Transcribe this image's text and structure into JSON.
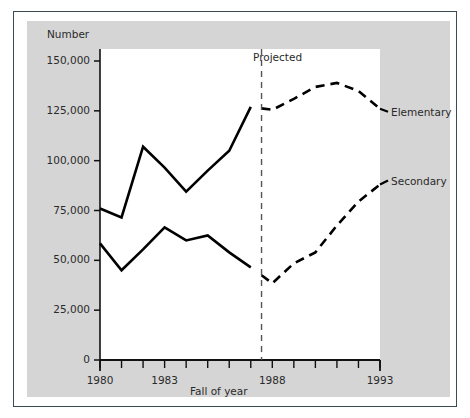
{
  "chart_data": {
    "type": "line",
    "title": "",
    "xlabel": "Fall of year",
    "ylabel": "Number",
    "ylim": [
      0,
      150000
    ],
    "xlim": [
      1980,
      1993
    ],
    "grid": false,
    "legend_position": "right-inline",
    "y_ticks": [
      0,
      25000,
      50000,
      75000,
      100000,
      125000,
      150000
    ],
    "y_tick_labels": [
      "0",
      "25,000",
      "50,000",
      "75,000",
      "100,000",
      "125,000",
      "150,000"
    ],
    "x_ticks": [
      1980,
      1981,
      1982,
      1983,
      1984,
      1985,
      1986,
      1987,
      1988,
      1989,
      1990,
      1991,
      1992,
      1993
    ],
    "x_tick_labels_shown": [
      "1980",
      "1983",
      "1988",
      "1993"
    ],
    "x_labeled_values": [
      1980,
      1983,
      1988,
      1993
    ],
    "annotations": [
      {
        "text": "Projected",
        "x": 1987.5,
        "style": "vertical-dashed-divider",
        "note": "dashed vertical line separating actual from projected data"
      }
    ],
    "projection_start_year": 1987.5,
    "series": [
      {
        "name": "Elementary",
        "label": "Elementary",
        "color": "#000000",
        "x": [
          1980,
          1981,
          1982,
          1983,
          1984,
          1985,
          1986,
          1987,
          1988,
          1989,
          1990,
          1991,
          1992,
          1993
        ],
        "values": [
          76000,
          71500,
          107000,
          96500,
          84500,
          95000,
          105000,
          127000,
          125500,
          131000,
          137000,
          139000,
          135000,
          126000
        ],
        "actual_through": 1987,
        "line_style_actual": "solid",
        "line_style_projected": "dashed"
      },
      {
        "name": "Secondary",
        "label": "Secondary",
        "color": "#000000",
        "x": [
          1980,
          1981,
          1982,
          1983,
          1984,
          1985,
          1986,
          1987,
          1988,
          1989,
          1990,
          1991,
          1992,
          1993
        ],
        "values": [
          58500,
          45000,
          55500,
          66500,
          60000,
          62500,
          54000,
          46500,
          38500,
          48500,
          54000,
          67500,
          79500,
          88000
        ],
        "actual_through": 1987,
        "line_style_actual": "solid",
        "line_style_projected": "dashed"
      }
    ]
  },
  "axes": {
    "y_title": "Number",
    "x_title": "Fall of year"
  },
  "labels": {
    "projected": "Projected",
    "elementary": "Elementary",
    "secondary": "Secondary"
  },
  "colors": {
    "panel_background": "#d5d5d5",
    "plot_background": "#ffffff",
    "line": "#000000",
    "frame": "#3c4a52",
    "text": "#2a2a2a"
  }
}
